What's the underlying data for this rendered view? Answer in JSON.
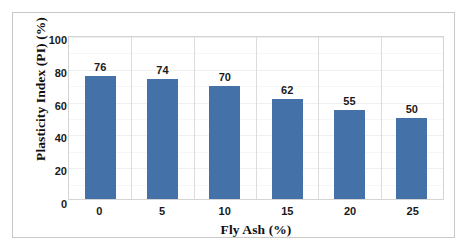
{
  "chart_data": {
    "type": "bar",
    "title": "",
    "categories": [
      "0",
      "5",
      "10",
      "15",
      "20",
      "25"
    ],
    "values": [
      76,
      74,
      70,
      62,
      55,
      50
    ],
    "data_labels": [
      "76",
      "74",
      "70",
      "62",
      "55",
      "50"
    ],
    "xlabel": "Fly Ash (%)",
    "ylabel": "Plasticity Index (PI) (%)",
    "ylim": [
      0,
      100
    ],
    "ytick_labels": [
      "0",
      "20",
      "40",
      "60",
      "80",
      "100"
    ],
    "ytick_values": [
      0,
      20,
      40,
      60,
      80,
      100
    ],
    "grid": {
      "horizontal": true,
      "vertical": true
    },
    "legend": {
      "visible": false,
      "position": "none"
    },
    "series": [
      {
        "name": "Plasticity Index (PI)",
        "values": [
          76,
          74,
          70,
          62,
          55,
          50
        ],
        "color": "#4472A8"
      }
    ]
  },
  "style": {
    "bar_color": "#4472A8",
    "frame_border_color": "#C9C9C9",
    "plot_border_color": "#D4D4D4",
    "gridline_color": "#EFEFEF",
    "category_gridline_color": "#DCDCDC",
    "background": "#FFFFFF",
    "text_color": "#1A1A1A"
  }
}
